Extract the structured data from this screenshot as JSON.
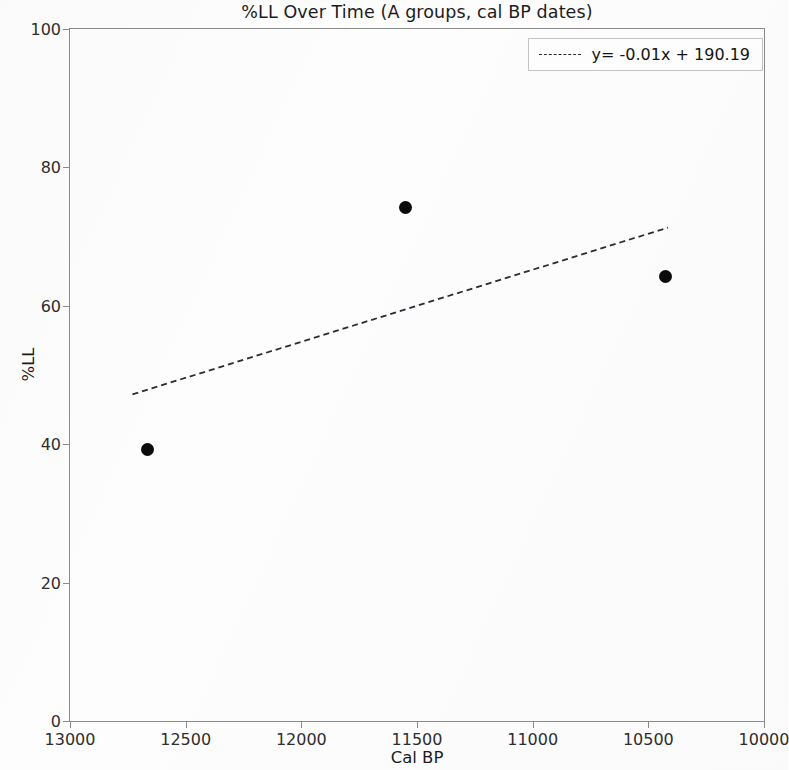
{
  "chart_data": {
    "type": "scatter",
    "title": "%LL Over Time (A groups, cal BP dates)",
    "xlabel": "Cal BP",
    "ylabel": "%LL",
    "xlim": [
      13000,
      10000
    ],
    "ylim": [
      0,
      100
    ],
    "x_reversed": true,
    "grid": false,
    "legend_position": "upper right",
    "xticks": [
      13000,
      12500,
      12000,
      11500,
      11000,
      10500,
      10000
    ],
    "xticklabels": [
      "13000",
      "12500",
      "12000",
      "11500",
      "11000",
      "10500",
      "10000"
    ],
    "yticks": [
      0,
      20,
      40,
      60,
      80,
      100
    ],
    "yticklabels": [
      "0",
      "20",
      "40",
      "60",
      "80",
      "100"
    ],
    "series": [
      {
        "name": "A groups",
        "type": "scatter",
        "marker": "circle",
        "color": "#0b0b0b",
        "points": [
          {
            "x": 12664,
            "y": 39.3
          },
          {
            "x": 11551,
            "y": 74.2
          },
          {
            "x": 10427,
            "y": 64.3
          }
        ]
      },
      {
        "name": "y= -0.01x + 190.19",
        "type": "line",
        "style": "dashed",
        "color": "#2b2b36",
        "slope": -0.01,
        "intercept": 190.19,
        "endpoints": [
          {
            "x": 12730,
            "y": 47.2
          },
          {
            "x": 10415,
            "y": 71.3
          }
        ]
      }
    ],
    "legend": [
      {
        "label": "y= -0.01x + 190.19",
        "marker": "dashed-line",
        "color": "#2b2b36"
      }
    ]
  }
}
